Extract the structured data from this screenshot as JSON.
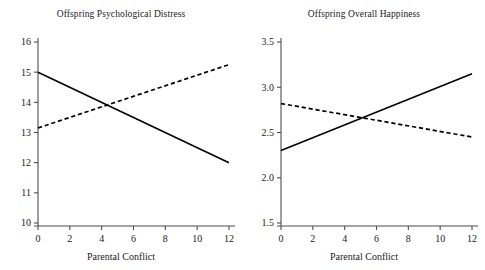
{
  "figure": {
    "background": "#ffffff",
    "line_color": "#000000",
    "axis_color": "#4d4d4d",
    "panel_count": 2
  },
  "chart_data": [
    {
      "type": "line",
      "title": "Offspring Psychological Distress",
      "xlabel": "Parental Conflict",
      "ylabel": "",
      "x": [
        0,
        12
      ],
      "xlim": [
        0,
        12
      ],
      "ylim": [
        10,
        16
      ],
      "xticks": [
        0,
        2,
        4,
        6,
        8,
        10,
        12
      ],
      "xticklabels": [
        "0",
        "2",
        "4",
        "6",
        "8",
        "10",
        "12"
      ],
      "yticks": [
        10,
        11,
        12,
        13,
        14,
        15,
        16
      ],
      "yticklabels": [
        "10",
        "11",
        "12",
        "13",
        "14",
        "15",
        "16"
      ],
      "grid": false,
      "legend": "none",
      "series": [
        {
          "name": "solid",
          "style": "solid",
          "values": [
            15.0,
            12.0
          ]
        },
        {
          "name": "dashed",
          "style": "dashed",
          "values": [
            13.15,
            15.25
          ]
        }
      ]
    },
    {
      "type": "line",
      "title": "Offspring Overall Happiness",
      "xlabel": "Parental Conflict",
      "ylabel": "",
      "x": [
        0,
        12
      ],
      "xlim": [
        0,
        12
      ],
      "ylim": [
        1.5,
        3.5
      ],
      "xticks": [
        0,
        2,
        4,
        6,
        8,
        10,
        12
      ],
      "xticklabels": [
        "0",
        "2",
        "4",
        "6",
        "8",
        "10",
        "12"
      ],
      "yticks": [
        1.5,
        2.0,
        2.5,
        3.0,
        3.5
      ],
      "yticklabels": [
        "1.5",
        "2.0",
        "2.5",
        "3.0",
        "3.5"
      ],
      "grid": false,
      "legend": "none",
      "series": [
        {
          "name": "solid",
          "style": "solid",
          "values": [
            2.3,
            3.15
          ]
        },
        {
          "name": "dashed",
          "style": "dashed",
          "values": [
            2.82,
            2.45
          ]
        }
      ]
    }
  ]
}
